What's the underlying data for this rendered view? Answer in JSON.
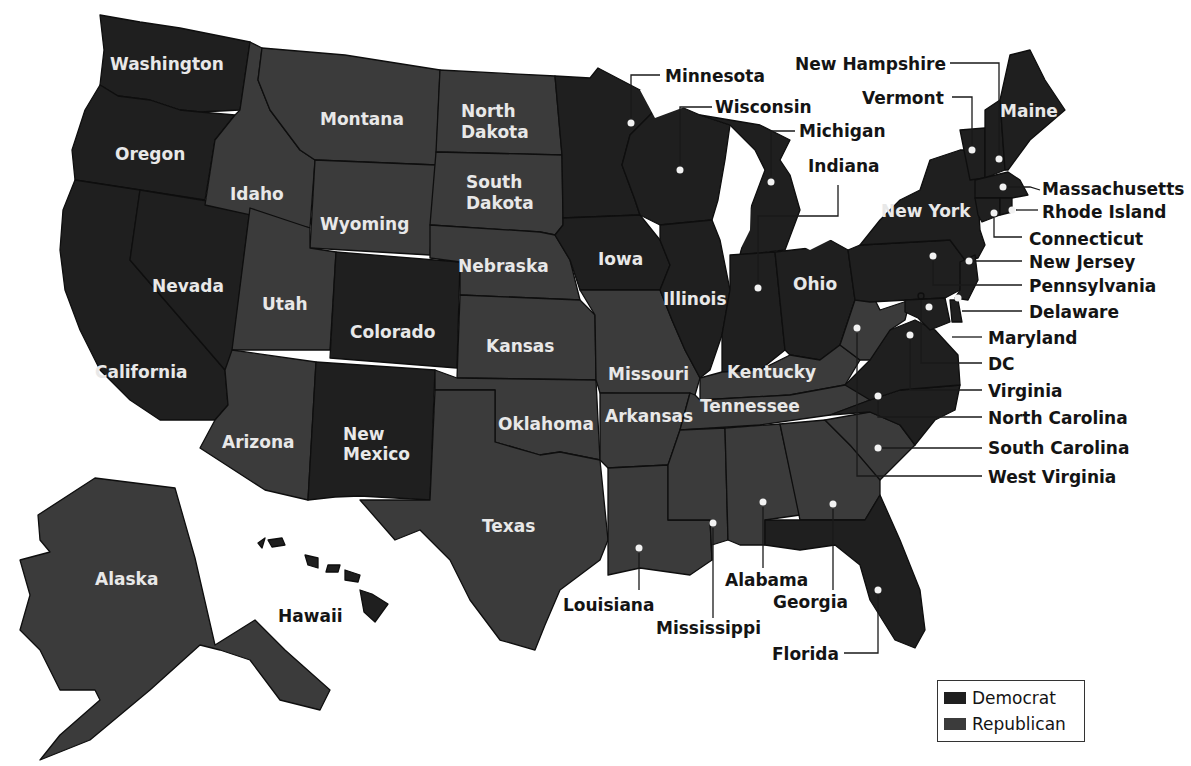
{
  "map": {
    "type": "choropleth",
    "subject": "United States by party",
    "colors": {
      "Democrat": "#1f1f1f",
      "Republican": "#3b3b3b"
    }
  },
  "legend": {
    "items": [
      {
        "label": "Democrat",
        "color": "#1f1f1f"
      },
      {
        "label": "Republican",
        "color": "#3b3b3b"
      }
    ]
  },
  "labels": {
    "WA": "Washington",
    "OR": "Oregon",
    "CA": "California",
    "NV": "Nevada",
    "ID": "Idaho",
    "MT": "Montana",
    "WY": "Wyoming",
    "UT": "Utah",
    "AZ": "Arizona",
    "CO": "Colorado",
    "NM_1": "New",
    "NM_2": "Mexico",
    "ND_1": "North",
    "ND_2": "Dakota",
    "SD_1": "South",
    "SD_2": "Dakota",
    "NE": "Nebraska",
    "KS": "Kansas",
    "OK": "Oklahoma",
    "TX": "Texas",
    "IA": "Iowa",
    "MO": "Missouri",
    "AR": "Arkansas",
    "IL": "Illinois",
    "OH": "Ohio",
    "KY": "Kentucky",
    "TN": "Tennessee",
    "NY": "New York",
    "ME": "Maine",
    "AK": "Alaska",
    "HI": "Hawaii",
    "MN": "Minnesota",
    "WI": "Wisconsin",
    "MI": "Michigan",
    "IN": "Indiana",
    "NH": "New Hampshire",
    "VT": "Vermont",
    "MA": "Massachusetts",
    "RI": "Rhode Island",
    "CT": "Connecticut",
    "NJ": "New Jersey",
    "PA": "Pennsylvania",
    "DE": "Delaware",
    "MD": "Maryland",
    "DC": "DC",
    "VA": "Virginia",
    "NC": "North Carolina",
    "SC": "South Carolina",
    "WV": "West Virginia",
    "LA": "Louisiana",
    "MS": "Mississippi",
    "AL": "Alabama",
    "GA": "Georgia",
    "FL": "Florida"
  },
  "states": [
    {
      "code": "WA",
      "name": "Washington",
      "party": "Democrat"
    },
    {
      "code": "OR",
      "name": "Oregon",
      "party": "Democrat"
    },
    {
      "code": "CA",
      "name": "California",
      "party": "Democrat"
    },
    {
      "code": "NV",
      "name": "Nevada",
      "party": "Democrat"
    },
    {
      "code": "ID",
      "name": "Idaho",
      "party": "Republican"
    },
    {
      "code": "MT",
      "name": "Montana",
      "party": "Republican"
    },
    {
      "code": "WY",
      "name": "Wyoming",
      "party": "Republican"
    },
    {
      "code": "UT",
      "name": "Utah",
      "party": "Republican"
    },
    {
      "code": "AZ",
      "name": "Arizona",
      "party": "Republican"
    },
    {
      "code": "CO",
      "name": "Colorado",
      "party": "Democrat"
    },
    {
      "code": "NM",
      "name": "New Mexico",
      "party": "Democrat"
    },
    {
      "code": "ND",
      "name": "North Dakota",
      "party": "Republican"
    },
    {
      "code": "SD",
      "name": "South Dakota",
      "party": "Republican"
    },
    {
      "code": "NE",
      "name": "Nebraska",
      "party": "Republican"
    },
    {
      "code": "KS",
      "name": "Kansas",
      "party": "Republican"
    },
    {
      "code": "OK",
      "name": "Oklahoma",
      "party": "Republican"
    },
    {
      "code": "TX",
      "name": "Texas",
      "party": "Republican"
    },
    {
      "code": "MN",
      "name": "Minnesota",
      "party": "Democrat"
    },
    {
      "code": "IA",
      "name": "Iowa",
      "party": "Democrat"
    },
    {
      "code": "MO",
      "name": "Missouri",
      "party": "Republican"
    },
    {
      "code": "AR",
      "name": "Arkansas",
      "party": "Republican"
    },
    {
      "code": "LA",
      "name": "Louisiana",
      "party": "Republican"
    },
    {
      "code": "WI",
      "name": "Wisconsin",
      "party": "Democrat"
    },
    {
      "code": "IL",
      "name": "Illinois",
      "party": "Democrat"
    },
    {
      "code": "MI",
      "name": "Michigan",
      "party": "Democrat"
    },
    {
      "code": "IN",
      "name": "Indiana",
      "party": "Democrat"
    },
    {
      "code": "OH",
      "name": "Ohio",
      "party": "Democrat"
    },
    {
      "code": "KY",
      "name": "Kentucky",
      "party": "Republican"
    },
    {
      "code": "TN",
      "name": "Tennessee",
      "party": "Republican"
    },
    {
      "code": "MS",
      "name": "Mississippi",
      "party": "Republican"
    },
    {
      "code": "AL",
      "name": "Alabama",
      "party": "Republican"
    },
    {
      "code": "GA",
      "name": "Georgia",
      "party": "Republican"
    },
    {
      "code": "FL",
      "name": "Florida",
      "party": "Democrat"
    },
    {
      "code": "SC",
      "name": "South Carolina",
      "party": "Republican"
    },
    {
      "code": "NC",
      "name": "North Carolina",
      "party": "Democrat"
    },
    {
      "code": "VA",
      "name": "Virginia",
      "party": "Democrat"
    },
    {
      "code": "WV",
      "name": "West Virginia",
      "party": "Republican"
    },
    {
      "code": "PA",
      "name": "Pennsylvania",
      "party": "Democrat"
    },
    {
      "code": "NY",
      "name": "New York",
      "party": "Democrat"
    },
    {
      "code": "VT",
      "name": "Vermont",
      "party": "Democrat"
    },
    {
      "code": "NH",
      "name": "New Hampshire",
      "party": "Democrat"
    },
    {
      "code": "ME",
      "name": "Maine",
      "party": "Democrat"
    },
    {
      "code": "MA",
      "name": "Massachusetts",
      "party": "Democrat"
    },
    {
      "code": "RI",
      "name": "Rhode Island",
      "party": "Democrat"
    },
    {
      "code": "CT",
      "name": "Connecticut",
      "party": "Democrat"
    },
    {
      "code": "NJ",
      "name": "New Jersey",
      "party": "Democrat"
    },
    {
      "code": "DE",
      "name": "Delaware",
      "party": "Democrat"
    },
    {
      "code": "MD",
      "name": "Maryland",
      "party": "Democrat"
    },
    {
      "code": "DC",
      "name": "DC",
      "party": "Democrat"
    },
    {
      "code": "AK",
      "name": "Alaska",
      "party": "Republican"
    },
    {
      "code": "HI",
      "name": "Hawaii",
      "party": "Democrat"
    }
  ]
}
